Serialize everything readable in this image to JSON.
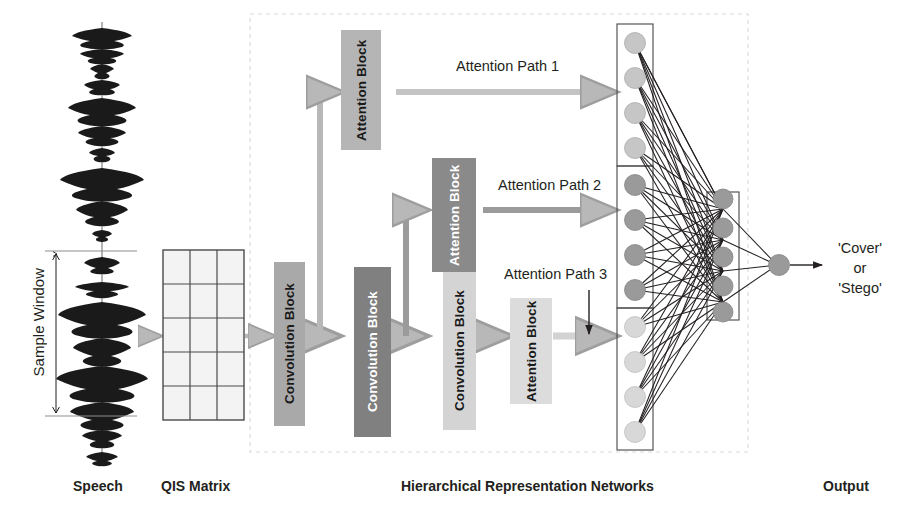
{
  "stage": {
    "width": 916,
    "height": 524
  },
  "sections": {
    "speech": {
      "caption": "Speech",
      "sample_window_label": "Sample Window"
    },
    "qis": {
      "caption": "QIS Matrix",
      "rows": 5,
      "cols": 3
    },
    "hrn": {
      "caption": "Hierarchical Representation Networks"
    },
    "output": {
      "caption": "Output",
      "result_lines": [
        "'Cover'",
        "or",
        "'Stego'"
      ]
    }
  },
  "blocks": {
    "conv1": {
      "label": "Convolution Block",
      "fill": "#a9a9a9",
      "text_color": "#1a1a1a"
    },
    "conv2": {
      "label": "Convolution Block",
      "fill": "#808080",
      "text_color": "#ffffff"
    },
    "conv3": {
      "label": "Convolution Block",
      "fill": "#d4d4d4",
      "text_color": "#1a1a1a"
    },
    "attn1": {
      "label": "Attention Block",
      "fill": "#b5b5b5",
      "text_color": "#1a1a1a"
    },
    "attn2": {
      "label": "Attention Block",
      "fill": "#8a8a8a",
      "text_color": "#ffffff"
    },
    "attn3": {
      "label": "Attention Block",
      "fill": "#dcdcdc",
      "text_color": "#1a1a1a"
    }
  },
  "paths": {
    "p1": "Attention Path 1",
    "p2": "Attention Path 2",
    "p3": "Attention Path 3"
  },
  "network": {
    "input_groups": 3,
    "nodes_per_group": 4,
    "input_total": 12,
    "hidden_nodes": 5,
    "output_nodes": 1,
    "group_fills": [
      "#c6c6c6",
      "#9a9a9a",
      "#d8d8d8"
    ],
    "hidden_fill": "#9a9a9a",
    "output_fill": "#9a9a9a"
  },
  "colors": {
    "arrow_gray": "#b8b8b8",
    "edge_black": "#231f20",
    "dashed_border": "#d9d9d9",
    "grid_line": "#4a4a4a",
    "grid_fill": "#f2f2f2",
    "waveform": "#1a1a1a"
  }
}
